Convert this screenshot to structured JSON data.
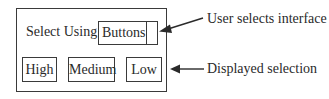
{
  "panel": {
    "select_label": "Select Using",
    "dropdown": {
      "selected_value": "Buttons"
    },
    "options": [
      {
        "label": "High"
      },
      {
        "label": "Medium"
      },
      {
        "label": "Low"
      }
    ]
  },
  "annotations": {
    "top": "User selects interface",
    "bottom": "Displayed selection"
  },
  "colors": {
    "line": "#2a2a2a",
    "background": "#ffffff"
  }
}
